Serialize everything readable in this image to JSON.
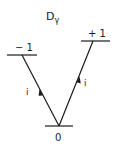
{
  "title": {
    "main": "D",
    "subscript": "γ"
  },
  "levels": [
    {
      "id": "minus-one",
      "label": "− 1"
    },
    {
      "id": "plus-one",
      "label": "+ 1"
    },
    {
      "id": "zero",
      "label": "0"
    }
  ],
  "transitions": [
    {
      "from": "0",
      "to": "-1",
      "label": "i"
    },
    {
      "from": "0",
      "to": "+1",
      "label": "i"
    }
  ],
  "colors": {
    "ink": "#1a1a1a",
    "background": "#ffffff"
  }
}
